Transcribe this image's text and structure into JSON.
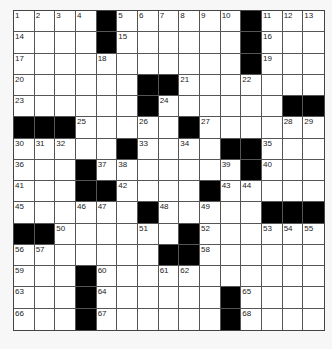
{
  "puzzle": {
    "rows": 15,
    "cols": 15,
    "layout": [
      "....#......#...",
      "....#......#...",
      "...........#...",
      "......##.......",
      "......#......##",
      "###....#.......",
      ".....#....##...",
      "...#......#.#...",
      "...##....#.....",
      "......#.....###",
      "##......#......",
      ".......##......",
      "...#...........",
      "...#......#....",
      "...#......#...."
    ],
    "numbers": {
      "0,0": "1",
      "0,1": "2",
      "0,2": "3",
      "0,3": "4",
      "0,5": "5",
      "0,6": "6",
      "0,7": "7",
      "0,8": "8",
      "0,9": "9",
      "0,10": "10",
      "0,12": "11",
      "0,13": "12",
      "0,14": "13",
      "1,0": "14",
      "1,5": "15",
      "1,12": "16",
      "2,0": "17",
      "2,4": "18",
      "2,12": "19",
      "3,0": "20",
      "3,8": "21",
      "3,11": "22",
      "4,0": "23",
      "4,7": "24",
      "5,3": "25",
      "5,6": "26",
      "5,9": "27",
      "5,13": "28",
      "5,14": "29",
      "6,0": "30",
      "6,1": "31",
      "6,2": "32",
      "6,6": "33",
      "6,8": "34",
      "6,12": "35",
      "7,0": "36",
      "7,4": "37",
      "7,5": "38",
      "7,10": "39",
      "7,12": "40",
      "8,0": "41",
      "8,5": "42",
      "8,10": "43",
      "8,11": "44",
      "9,0": "45",
      "9,3": "46",
      "9,4": "47",
      "9,7": "48",
      "9,9": "49",
      "10,2": "50",
      "10,6": "51",
      "10,9": "52",
      "10,12": "53",
      "10,13": "54",
      "10,14": "55",
      "11,0": "56",
      "11,1": "57",
      "11,9": "58",
      "12,0": "59",
      "12,4": "60",
      "12,7": "61",
      "12,8": "62",
      "13,0": "63",
      "13,4": "64",
      "13,11": "65",
      "14,0": "66",
      "14,4": "67",
      "14,11": "68"
    }
  }
}
